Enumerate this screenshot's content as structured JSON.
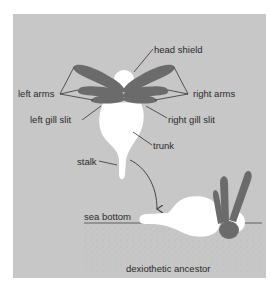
{
  "diagram": {
    "labels": {
      "head_shield": "head shield",
      "left_arms": "left arms",
      "right_arms": "right arms",
      "left_gill_slit": "left gill slit",
      "right_gill_slit": "right gill slit",
      "trunk": "trunk",
      "stalk": "stalk",
      "sea_bottom": "sea bottom",
      "dexiothetic_ancestor": "dexiothetic ancestor"
    },
    "colors": {
      "background": "#c7c7c7",
      "arms": "#6b6b6b",
      "body": "#ffffff",
      "line": "#333333"
    }
  }
}
